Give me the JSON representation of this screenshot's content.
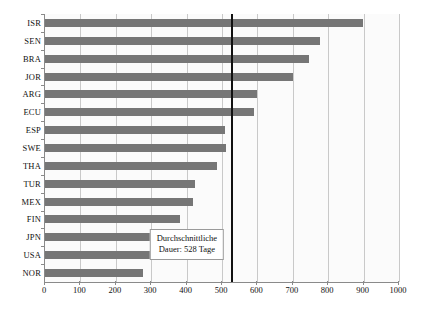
{
  "chart_data": {
    "type": "bar",
    "orientation": "horizontal",
    "title": "",
    "xlabel": "",
    "ylabel": "",
    "xlim": [
      0,
      1000
    ],
    "xticks": [
      0,
      100,
      200,
      300,
      400,
      500,
      600,
      700,
      800,
      900,
      1000
    ],
    "grid": true,
    "legend": false,
    "bar_color": "#767676",
    "categories": [
      "ISR",
      "SEN",
      "BRA",
      "JOR",
      "ARG",
      "ECU",
      "ESP",
      "SWE",
      "THA",
      "TUR",
      "MEX",
      "FIN",
      "JPN",
      "USA",
      "NOR"
    ],
    "values": [
      898,
      777,
      745,
      700,
      600,
      590,
      508,
      510,
      486,
      424,
      418,
      381,
      362,
      300,
      277
    ],
    "reference_line": {
      "value": 528,
      "color": "#111111",
      "label_line1": "Durchschnittliche",
      "label_line2": "Dauer: 528 Tage"
    }
  },
  "annotation": {
    "line1": "Durchschnittliche",
    "line2": "Dauer: 528 Tage"
  }
}
